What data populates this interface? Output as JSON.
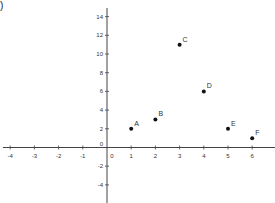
{
  "corner_label": ")",
  "chart_data": {
    "type": "scatter",
    "title": "",
    "xlabel": "",
    "ylabel": "",
    "xlim": [
      -4.3,
      6.8
    ],
    "ylim": [
      -5.8,
      15.8
    ],
    "grid": false,
    "legend": null,
    "x_ticks": [
      -4,
      -3,
      -2,
      -1,
      0,
      1,
      2,
      3,
      4,
      5,
      6
    ],
    "x_tick_labels": [
      "-4",
      "-3",
      "-2",
      "-1",
      "0",
      "1",
      "2",
      "3",
      "4",
      "5",
      "6"
    ],
    "y_ticks": [
      -4,
      -2,
      0,
      2,
      4,
      6,
      8,
      10,
      12,
      14
    ],
    "y_tick_labels": [
      "-4",
      "-2",
      "0",
      "2",
      "4",
      "6",
      "8",
      "10",
      "12",
      "14"
    ],
    "points": [
      {
        "label": "A",
        "x": 1,
        "y": 2
      },
      {
        "label": "B",
        "x": 2,
        "y": 3
      },
      {
        "label": "C",
        "x": 3,
        "y": 11
      },
      {
        "label": "D",
        "x": 4,
        "y": 6
      },
      {
        "label": "E",
        "x": 5,
        "y": 2
      },
      {
        "label": "F",
        "x": 6,
        "y": 1
      }
    ],
    "colors": {
      "axis": "#444444",
      "point": "#111111",
      "text": "#333333"
    }
  }
}
